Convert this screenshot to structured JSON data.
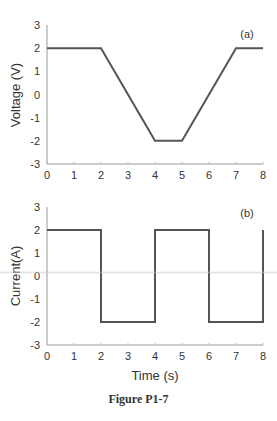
{
  "chart_data": [
    {
      "type": "line",
      "panel_label": "(a)",
      "title": "",
      "xlabel": "",
      "ylabel": "Voltage (V)",
      "x": [
        0,
        2,
        4,
        5,
        7,
        8
      ],
      "values": [
        2,
        2,
        -2,
        -2,
        2,
        2
      ],
      "xlim": [
        0,
        8
      ],
      "ylim": [
        -3,
        3
      ],
      "xticks": [
        "0",
        "1",
        "2",
        "3",
        "4",
        "5",
        "6",
        "7",
        "8"
      ],
      "yticks": [
        "3",
        "2",
        "1",
        "0",
        "-1",
        "-2",
        "-3"
      ],
      "grid": false
    },
    {
      "type": "line",
      "panel_label": "(b)",
      "title": "",
      "xlabel": "Time (s)",
      "ylabel": "Current(A)",
      "x": [
        0,
        2,
        2,
        4,
        4,
        6,
        6,
        8,
        8
      ],
      "values": [
        2,
        2,
        -2,
        -2,
        2,
        2,
        -2,
        -2,
        2
      ],
      "xlim": [
        0,
        8
      ],
      "ylim": [
        -3,
        3
      ],
      "xticks": [
        "0",
        "1",
        "2",
        "3",
        "4",
        "5",
        "6",
        "7",
        "8"
      ],
      "yticks": [
        "3",
        "2",
        "1",
        "0",
        "-1",
        "-2",
        "-3"
      ],
      "grid": false
    }
  ],
  "caption": "Figure P1-7"
}
